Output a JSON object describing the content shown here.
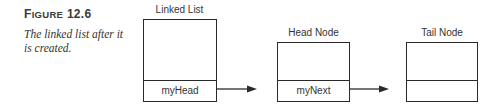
{
  "figure": {
    "label_prefix": "F",
    "label_smallcaps": "IGURE",
    "number": "12.6",
    "caption": "The linked list after it is created."
  },
  "diagram": {
    "nodes": [
      {
        "id": "linked-list",
        "title": "Linked List",
        "field": "myHead"
      },
      {
        "id": "head-node",
        "title": "Head Node",
        "field": "myNext"
      },
      {
        "id": "tail-node",
        "title": "Tail Node",
        "field": ""
      }
    ],
    "edges": [
      {
        "from": "linked-list.myHead",
        "to": "head-node"
      },
      {
        "from": "head-node.myNext",
        "to": "tail-node"
      }
    ],
    "colors": {
      "stroke": "#2a2a2a",
      "text": "#333333"
    }
  }
}
